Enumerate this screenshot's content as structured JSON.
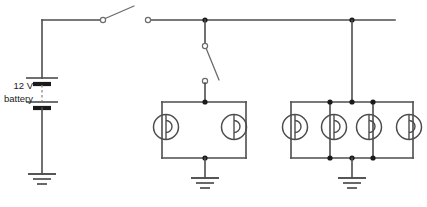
{
  "diagram": {
    "type": "schematic",
    "background_color": "#ffffff",
    "wire_color": "#4d4d4d",
    "node_color": "#1a1a1a",
    "battery": {
      "label_line1": "12 V",
      "label_line2": "battery",
      "voltage": "12 V",
      "cells": 2,
      "name": "battery-12v"
    },
    "switches": [
      {
        "name": "switch-top-horizontal",
        "orientation": "horizontal",
        "state": "open",
        "label": ""
      },
      {
        "name": "switch-branch-vertical",
        "orientation": "vertical",
        "state": "open",
        "label": ""
      }
    ],
    "lamp_groups": [
      {
        "name": "lamp-group-left",
        "lamp_count": 2,
        "arrangement": "parallel",
        "grounded": true
      },
      {
        "name": "lamp-group-right",
        "lamp_count": 4,
        "arrangement": "parallel",
        "grounded": true
      }
    ],
    "grounds": [
      {
        "name": "ground-battery"
      },
      {
        "name": "ground-lamp-group-left"
      },
      {
        "name": "ground-lamp-group-right"
      }
    ],
    "junction_count": 8
  }
}
